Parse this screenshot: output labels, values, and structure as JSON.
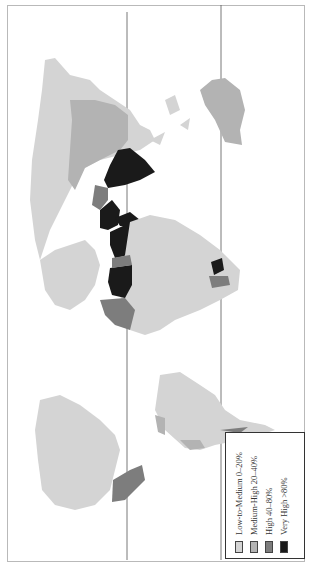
{
  "map": {
    "title": "",
    "orientation": "rotated 90 degrees counter-clockwise",
    "reference_lines": [
      "equator-line",
      "tropic-line"
    ],
    "colors": {
      "low_medium": "#d4d4d4",
      "medium_high": "#b3b3b3",
      "high": "#7d7d7d",
      "very_high": "#1a1a1a",
      "no_data": "#ffffff",
      "frame": "#b9b9b9"
    }
  },
  "legend": {
    "items": [
      {
        "label": "Low-to-Medium 0–20%",
        "color": "#d4d4d4"
      },
      {
        "label": "Medium-High 20–40%",
        "color": "#b3b3b3"
      },
      {
        "label": "High 40–80%",
        "color": "#7d7d7d"
      },
      {
        "label": "Very High >80%",
        "color": "#1a1a1a"
      }
    ]
  }
}
